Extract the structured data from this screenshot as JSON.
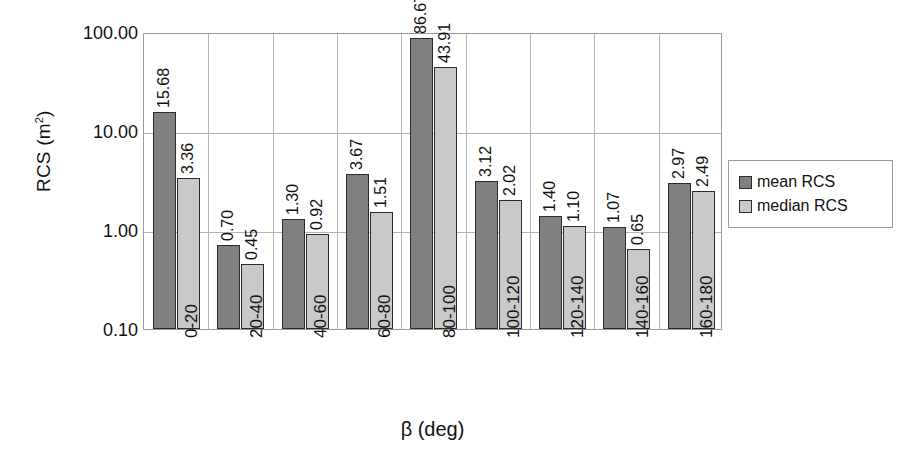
{
  "chart_data": {
    "type": "bar",
    "title": "",
    "xlabel": "β (deg)",
    "ylabel": "RCS (m²)",
    "ylabel_base": "RCS (m",
    "ylabel_sup": "2",
    "ylabel_close": ")",
    "yscale": "log",
    "ylim": [
      0.1,
      100.0
    ],
    "grid": true,
    "legend_position": "right",
    "ytick_labels": [
      "100.00",
      "10.00",
      "1.00",
      "0.10"
    ],
    "ytick_values": [
      100.0,
      10.0,
      1.0,
      0.1
    ],
    "categories": [
      "0-20",
      "20-40",
      "40-60",
      "60-80",
      "80-100",
      "100-120",
      "120-140",
      "140-160",
      "160-180"
    ],
    "series": [
      {
        "name": "mean RCS",
        "color": "#808080",
        "values": [
          15.68,
          0.7,
          1.3,
          3.67,
          86.67,
          3.12,
          1.4,
          1.07,
          2.97
        ],
        "labels": [
          "15.68",
          "0.70",
          "1.30",
          "3.67",
          "86.67",
          "3.12",
          "1.40",
          "1.07",
          "2.97"
        ]
      },
      {
        "name": "median RCS",
        "color": "#c9c9c9",
        "values": [
          3.36,
          0.45,
          0.92,
          1.51,
          43.91,
          2.02,
          1.1,
          0.65,
          2.49
        ],
        "labels": [
          "3.36",
          "0.45",
          "0.92",
          "1.51",
          "43.91",
          "2.02",
          "1.10",
          "0.65",
          "2.49"
        ]
      }
    ]
  },
  "legend": {
    "items": [
      {
        "label": "mean RCS",
        "swatch": "mean"
      },
      {
        "label": "median RCS",
        "swatch": "median"
      }
    ]
  },
  "colors": {
    "mean": "#808080",
    "median": "#c9c9c9",
    "bar_border": "#2b2b2b",
    "grid": "#b4b4b4",
    "frame": "#9a9a9a",
    "text": "#111111",
    "background": "#ffffff"
  }
}
